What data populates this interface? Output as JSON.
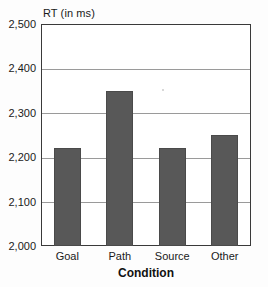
{
  "chart_data": {
    "type": "bar",
    "title": "",
    "xlabel": "Condition",
    "ylabel": "RT (in ms)",
    "categories": [
      "Goal",
      "Path",
      "Source",
      "Other"
    ],
    "values": [
      2220,
      2350,
      2220,
      2250
    ],
    "ylim": [
      2000,
      2500
    ],
    "ytick_labels": [
      "2,000",
      "2,100",
      "2,200",
      "2,300",
      "2,400",
      "2,500"
    ],
    "ytick_values": [
      2000,
      2100,
      2200,
      2300,
      2400,
      2500
    ],
    "grid": "horizontal",
    "legend": "none",
    "bar_color": "#585858",
    "frame_color": "#3a3a3a",
    "gridline_color": "#9a9a9a"
  }
}
